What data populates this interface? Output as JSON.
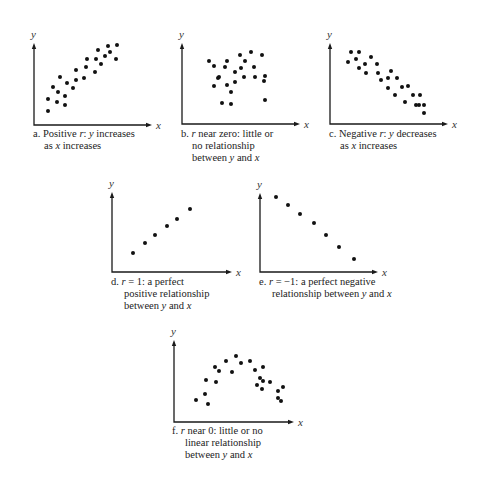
{
  "chart_data": [
    {
      "type": "scatter",
      "id": "a",
      "xlabel": "x",
      "ylabel": "y",
      "caption_lines": [
        "a. Positive r: y increases",
        "as x increases"
      ],
      "axis": {
        "ox": 34,
        "oy": 125,
        "top": 43,
        "right": 152
      },
      "points": [
        [
          48,
          111
        ],
        [
          48,
          99
        ],
        [
          53,
          87
        ],
        [
          57,
          102
        ],
        [
          58,
          92
        ],
        [
          60,
          77
        ],
        [
          65,
          105
        ],
        [
          65,
          96
        ],
        [
          67,
          83
        ],
        [
          73,
          88
        ],
        [
          76,
          70
        ],
        [
          76,
          80
        ],
        [
          84,
          78
        ],
        [
          86,
          67
        ],
        [
          87,
          59
        ],
        [
          95,
          72
        ],
        [
          96,
          59
        ],
        [
          98,
          50
        ],
        [
          101,
          64
        ],
        [
          105,
          56
        ],
        [
          108,
          46
        ],
        [
          110,
          52
        ],
        [
          116,
          59
        ],
        [
          117,
          45
        ]
      ]
    },
    {
      "type": "scatter",
      "id": "b",
      "xlabel": "x",
      "ylabel": "y",
      "caption_lines": [
        "b. r near zero: little or",
        "no relationship",
        "between y and x"
      ],
      "axis": {
        "ox": 182,
        "oy": 124,
        "top": 43,
        "right": 300
      },
      "points": [
        [
          209,
          61
        ],
        [
          214,
          66
        ],
        [
          214,
          86
        ],
        [
          218,
          78
        ],
        [
          219,
          77
        ],
        [
          222,
          103
        ],
        [
          225,
          67
        ],
        [
          227,
          85
        ],
        [
          227,
          61
        ],
        [
          231,
          92
        ],
        [
          231,
          104
        ],
        [
          235,
          82
        ],
        [
          235,
          72
        ],
        [
          240,
          55
        ],
        [
          241,
          68
        ],
        [
          244,
          77
        ],
        [
          245,
          61
        ],
        [
          251,
          52
        ],
        [
          254,
          67
        ],
        [
          255,
          77
        ],
        [
          262,
          55
        ],
        [
          264,
          81
        ],
        [
          265,
          76
        ],
        [
          265,
          100
        ]
      ]
    },
    {
      "type": "scatter",
      "id": "c",
      "xlabel": "x",
      "ylabel": "y",
      "caption_lines": [
        "c. Negative r: y decreases",
        "as x increases"
      ],
      "axis": {
        "ox": 330,
        "oy": 124,
        "top": 43,
        "right": 448
      },
      "points": [
        [
          348,
          62
        ],
        [
          351,
          52
        ],
        [
          356,
          59
        ],
        [
          359,
          68
        ],
        [
          359,
          52
        ],
        [
          365,
          64
        ],
        [
          366,
          73
        ],
        [
          371,
          57
        ],
        [
          377,
          64
        ],
        [
          378,
          73
        ],
        [
          381,
          80
        ],
        [
          388,
          78
        ],
        [
          388,
          88
        ],
        [
          391,
          71
        ],
        [
          395,
          95
        ],
        [
          397,
          78
        ],
        [
          402,
          87
        ],
        [
          405,
          102
        ],
        [
          408,
          86
        ],
        [
          413,
          95
        ],
        [
          416,
          105
        ],
        [
          419,
          105
        ],
        [
          420,
          95
        ],
        [
          424,
          105
        ],
        [
          424,
          113
        ]
      ]
    },
    {
      "type": "scatter",
      "id": "d",
      "xlabel": "x",
      "ylabel": "y",
      "caption_lines": [
        "d.  r = 1: a perfect",
        "positive relationship",
        "between y and x"
      ],
      "axis": {
        "ox": 112,
        "oy": 272,
        "top": 192,
        "right": 232
      },
      "points": [
        [
          133,
          253
        ],
        [
          145,
          243
        ],
        [
          155,
          235
        ],
        [
          167,
          226
        ],
        [
          177,
          219
        ],
        [
          190,
          209
        ]
      ]
    },
    {
      "type": "scatter",
      "id": "e",
      "xlabel": "x",
      "ylabel": "y",
      "caption_lines": [
        "e.  r = −1: a perfect negative",
        "relationship between y and x"
      ],
      "axis": {
        "ox": 260,
        "oy": 272,
        "top": 193,
        "right": 378
      },
      "points": [
        [
          276,
          197
        ],
        [
          288,
          205
        ],
        [
          300,
          214
        ],
        [
          314,
          223
        ],
        [
          326,
          235
        ],
        [
          339,
          247
        ],
        [
          354,
          259
        ]
      ]
    },
    {
      "type": "scatter",
      "id": "f",
      "xlabel": "x",
      "ylabel": "y",
      "caption_lines": [
        "f.  r near 0: little or no",
        "linear relationship",
        "between y and x"
      ],
      "axis": {
        "ox": 174,
        "oy": 422,
        "top": 340,
        "right": 294
      },
      "points": [
        [
          196,
          400
        ],
        [
          205,
          394
        ],
        [
          208,
          404
        ],
        [
          206,
          380
        ],
        [
          215,
          367
        ],
        [
          216,
          382
        ],
        [
          219,
          371
        ],
        [
          226,
          361
        ],
        [
          232,
          372
        ],
        [
          236,
          356
        ],
        [
          241,
          363
        ],
        [
          250,
          361
        ],
        [
          255,
          370
        ],
        [
          260,
          378
        ],
        [
          257,
          385
        ],
        [
          263,
          381
        ],
        [
          263,
          367
        ],
        [
          262,
          389
        ],
        [
          270,
          382
        ],
        [
          278,
          391
        ],
        [
          278,
          398
        ],
        [
          281,
          401
        ],
        [
          283,
          387
        ]
      ]
    }
  ],
  "labels": {
    "y": "y",
    "x": "x"
  },
  "captions": {
    "a": {
      "prefix": "a. Positive ",
      "r": "r",
      "mid": ": ",
      "var1": "y",
      "rest1": " increases",
      "line2_pre": "as ",
      "var2": "x",
      "line2_post": " increases"
    },
    "b": {
      "line1_pre": "b. ",
      "r": "r",
      "line1_post": " near zero: little or",
      "line2": "no relationship",
      "line3_pre": "between ",
      "var1": "y",
      "line3_mid": " and ",
      "var2": "x"
    },
    "c": {
      "prefix": "c. Negative ",
      "r": "r",
      "mid": ": ",
      "var1": "y",
      "rest1": " decreases",
      "line2_pre": "as ",
      "var2": "x",
      "line2_post": " increases"
    },
    "d": {
      "line1_pre": "d.  ",
      "r": "r",
      "line1_post": " = 1: a perfect",
      "line2": "positive relationship",
      "line3_pre": "between ",
      "var1": "y",
      "line3_mid": " and ",
      "var2": "x"
    },
    "e": {
      "line1_pre": "e.  ",
      "r": "r",
      "line1_post": " = −1: a perfect negative",
      "line2_pre": "relationship between ",
      "var1": "y",
      "line2_mid": " and ",
      "var2": "x"
    },
    "f": {
      "line1_pre": "f.  ",
      "r": "r",
      "line1_post": " near 0: little or no",
      "line2": "linear relationship",
      "line3_pre": "between ",
      "var1": "y",
      "line3_mid": " and ",
      "var2": "x"
    }
  }
}
